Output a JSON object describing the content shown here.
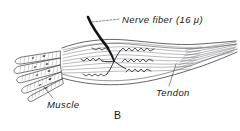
{
  "figure": {
    "caption": "B",
    "labels": {
      "nerve_fiber": "Nerve fiber (16 μ)",
      "muscle": "Muscle",
      "tendon": "Tendon"
    },
    "colors": {
      "ink": "#17171a",
      "line": "#3a3a3f",
      "hatch": "#6d6d72",
      "background": "#ffffff"
    }
  }
}
